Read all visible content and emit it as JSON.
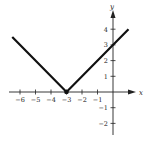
{
  "chart_data": {
    "type": "line",
    "title": "",
    "function": "y = |x + 3|",
    "xlabel": "x",
    "ylabel": "y",
    "xlim": [
      -6.5,
      1.5
    ],
    "ylim": [
      -2.5,
      4.8
    ],
    "x_ticks": [
      -6,
      -5,
      -4,
      -3,
      -2,
      -1
    ],
    "y_ticks": [
      -2,
      -1,
      1,
      2,
      3,
      4
    ],
    "x_tick_labels": [
      "−6",
      "−5",
      "−4",
      "−3",
      "−2",
      "−1"
    ],
    "y_tick_labels": [
      "−2",
      "−1",
      "1",
      "2",
      "3",
      "4"
    ],
    "grid": false,
    "series": [
      {
        "name": "y = |x + 3|",
        "x": [
          -6.5,
          -3,
          1
        ],
        "y": [
          3.5,
          0,
          4
        ],
        "color": "#111111"
      }
    ],
    "annotations": [
      {
        "type": "point",
        "x": -3,
        "y": 0,
        "label": "vertex"
      }
    ]
  }
}
